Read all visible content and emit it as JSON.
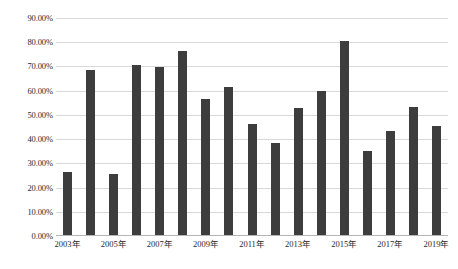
{
  "chart_data": {
    "type": "bar",
    "title": "",
    "subtitle": "",
    "xlabel": "",
    "ylabel": "",
    "grid": true,
    "legend": false,
    "legend_position": "none",
    "bar_color": "#3d3d3d",
    "gridline_color": "#d9d9d9",
    "axis_color": "#b5b5b5",
    "ylim": [
      0,
      90
    ],
    "y_unit": "%",
    "y_ticks": [
      0,
      10,
      20,
      30,
      40,
      50,
      60,
      70,
      80,
      90
    ],
    "y_tick_labels": [
      "0.00%",
      "10.00%",
      "20.00%",
      "30.00%",
      "40.00%",
      "50.00%",
      "60.00%",
      "70.00%",
      "80.00%",
      "90.00%"
    ],
    "categories": [
      "2003年",
      "2004年",
      "2005年",
      "2006年",
      "2007年",
      "2008年",
      "2009年",
      "2010年",
      "2011年",
      "2012年",
      "2013年",
      "2014年",
      "2015年",
      "2016年",
      "2017年",
      "2018年",
      "2019年"
    ],
    "x_tick_labels_shown": [
      "2003年",
      "2005年",
      "2007年",
      "2009年",
      "2011年",
      "2013年",
      "2015年",
      "2017年",
      "2019年"
    ],
    "values": [
      26,
      68,
      25,
      70,
      69.5,
      76,
      56,
      61,
      46,
      38,
      52.5,
      59.5,
      80,
      34.5,
      43,
      53,
      45
    ]
  }
}
